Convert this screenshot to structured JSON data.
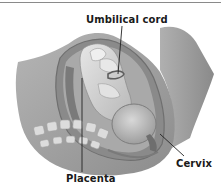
{
  "figure": {
    "labels": {
      "umbilical_cord": "Umbilical cord",
      "placenta": "Placenta",
      "cervix": "Cervix"
    },
    "colors": {
      "background": "#ffffff",
      "body_tissue": "#9a9a9a",
      "uterine_wall": "#7f7f7f",
      "fetus": "#cfcfcf",
      "spine": "#d9d9d9",
      "label_text": "#1a1a1a",
      "leader_line": "#222222",
      "top_rule": "#8a8a8a"
    }
  }
}
